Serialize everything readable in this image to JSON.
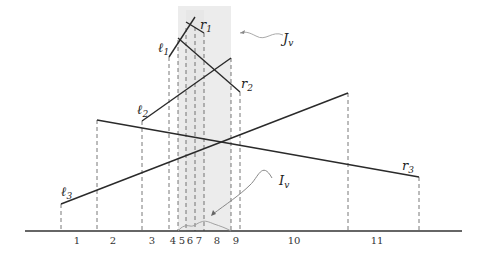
{
  "diagram": {
    "baseline": {
      "x1": 25,
      "x2": 462,
      "y": 231
    },
    "shaded_region": {
      "x1": 178,
      "x2": 231,
      "y_top": 6,
      "color": "#ececec"
    },
    "dashed_x": [
      61,
      97,
      142,
      169,
      178,
      186,
      195,
      204,
      231,
      240,
      348,
      419
    ],
    "segment_labels": [
      {
        "text": "1",
        "x": 77
      },
      {
        "text": "2",
        "x": 113
      },
      {
        "text": "3",
        "x": 152
      },
      {
        "text": "4",
        "x": 173
      },
      {
        "text": "5",
        "x": 182
      },
      {
        "text": "6",
        "x": 190
      },
      {
        "text": "7",
        "x": 199
      },
      {
        "text": "8",
        "x": 217
      },
      {
        "text": "9",
        "x": 236
      },
      {
        "text": "10",
        "x": 294
      },
      {
        "text": "11",
        "x": 377
      }
    ],
    "segments": [
      {
        "name": "segment-l3",
        "x1": 61,
        "y1": 204,
        "x2": 348,
        "y2": 93
      },
      {
        "name": "segment-r3",
        "x1": 97,
        "y1": 120,
        "x2": 419,
        "y2": 177
      },
      {
        "name": "segment-l2",
        "x1": 142,
        "y1": 121,
        "x2": 231,
        "y2": 58
      },
      {
        "name": "segment-l1",
        "x1": 169,
        "y1": 57,
        "x2": 195,
        "y2": 17
      },
      {
        "name": "segment-r2",
        "x1": 178,
        "y1": 38,
        "x2": 240,
        "y2": 92
      },
      {
        "name": "segment-r1",
        "x1": 186,
        "y1": 22,
        "x2": 204,
        "y2": 33
      }
    ],
    "labels": {
      "l1": {
        "main": "ℓ",
        "sub": "1"
      },
      "l2": {
        "main": "ℓ",
        "sub": "2"
      },
      "l3": {
        "main": "ℓ",
        "sub": "3"
      },
      "r1": {
        "main": "r",
        "sub": "1"
      },
      "r2": {
        "main": "r",
        "sub": "2"
      },
      "r3": {
        "main": "r",
        "sub": "3"
      },
      "Jv": {
        "main": "J",
        "sub": "v"
      },
      "Iv": {
        "main": "I",
        "sub": "v"
      }
    }
  }
}
